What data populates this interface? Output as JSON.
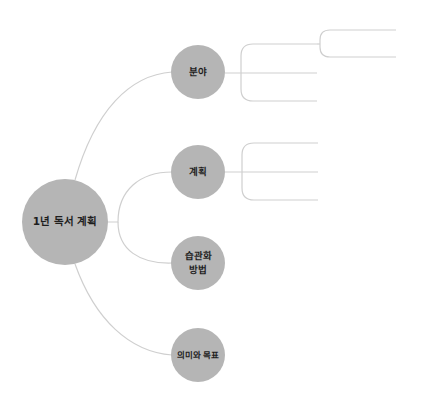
{
  "mindmap": {
    "root": {
      "label": "1년 독서 계획",
      "cx": 65,
      "cy": 222,
      "r": 43
    },
    "children": [
      {
        "label": "분야",
        "cx": 198,
        "cy": 72,
        "r": 27,
        "branches": [
          {
            "y": 44,
            "x_end": 317,
            "sub_branches": [
              {
                "y": 30,
                "x_end": 396
              },
              {
                "y": 57,
                "x_end": 396
              }
            ]
          },
          {
            "y": 73,
            "x_end": 317
          },
          {
            "y": 101,
            "x_end": 317
          }
        ]
      },
      {
        "label": "계획",
        "cx": 198,
        "cy": 172,
        "r": 27,
        "branches": [
          {
            "y": 143,
            "x_end": 318
          },
          {
            "y": 172,
            "x_end": 318
          },
          {
            "y": 200,
            "x_end": 318
          }
        ]
      },
      {
        "label": "습관화\n방법",
        "cx": 198,
        "cy": 263,
        "r": 27,
        "branches": []
      },
      {
        "label": "의미와 목표",
        "cx": 198,
        "cy": 355,
        "r": 27,
        "branches": []
      }
    ]
  },
  "colors": {
    "node_fill": "#b5b5b5",
    "line": "#cfcfcf",
    "text": "#1e1e1e",
    "background": "#ffffff"
  }
}
